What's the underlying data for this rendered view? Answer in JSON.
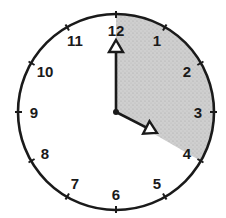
{
  "clock": {
    "center": [
      116,
      112
    ],
    "radius": 98,
    "numbers": [
      "12",
      "1",
      "2",
      "3",
      "4",
      "5",
      "6",
      "7",
      "8",
      "9",
      "10",
      "11"
    ],
    "time": "4:00",
    "hands": {
      "minute": {
        "points_to": "12",
        "angle_deg": 0,
        "length": 70
      },
      "hour": {
        "points_to": "4",
        "angle_deg": 117,
        "length": 44
      }
    },
    "shaded_sector": {
      "from": "12",
      "to": "4",
      "start_deg": 0,
      "end_deg": 120,
      "color": "#c8c8c8"
    },
    "colors": {
      "stroke": "#1a1a1a",
      "background": "#ffffff"
    }
  }
}
